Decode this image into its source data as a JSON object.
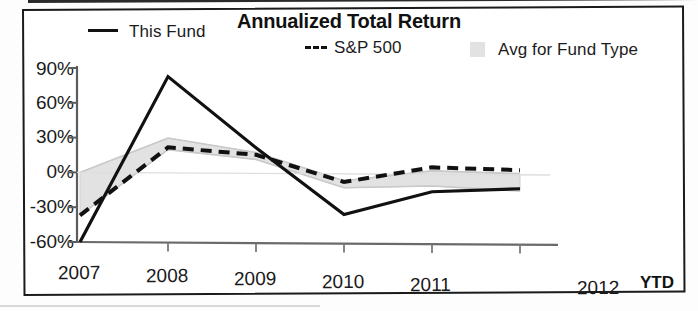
{
  "chart_data": {
    "type": "line",
    "title": "Annualized Total Return",
    "xlabel": "",
    "ylabel": "",
    "categories": [
      "2007",
      "2008",
      "2009",
      "2010",
      "2011",
      "2012"
    ],
    "x_axis_note": "YTD",
    "ytick_labels": [
      "90%",
      "60%",
      "30%",
      "0%",
      "-30%",
      "-60%"
    ],
    "ytick_values": [
      90,
      60,
      30,
      0,
      -30,
      -60
    ],
    "ylim": [
      -60,
      90
    ],
    "grid": false,
    "legend_position": "top",
    "series": [
      {
        "name": "This Fund",
        "style": "solid",
        "color": "#111111",
        "values": [
          -60,
          83,
          22,
          -35,
          -15,
          -12
        ]
      },
      {
        "name": "S&P 500",
        "style": "dashed",
        "color": "#111111",
        "values": [
          -37,
          22,
          16,
          -7,
          6,
          4
        ]
      },
      {
        "name": "Avg for Fund Type",
        "style": "band",
        "color": "#e2e2e2",
        "upper": [
          0,
          30,
          18,
          -6,
          3,
          1
        ],
        "lower": [
          -37,
          20,
          12,
          -12,
          -10,
          -14
        ]
      }
    ]
  },
  "legend": {
    "fund_label": "This Fund",
    "sp_label": "S&P 500",
    "avg_label": "Avg for Fund Type"
  },
  "icons": {
    "fund_line_swatch": "solid-line-icon",
    "sp_dash_swatch": "dashed-line-icon",
    "avg_box_swatch": "gray-square-icon"
  }
}
